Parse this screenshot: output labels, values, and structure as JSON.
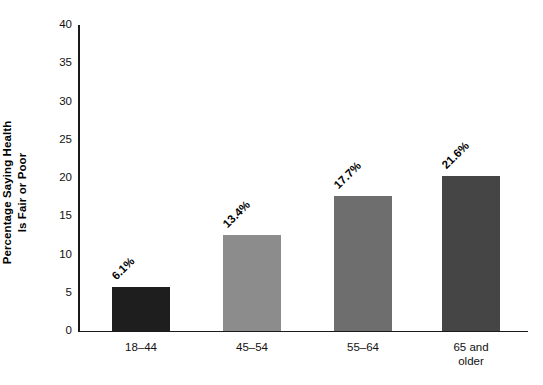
{
  "chart_data": {
    "type": "bar",
    "title": "",
    "subtitle": "",
    "xlabel": "",
    "ylabel": "Percentage Saying Health Is Fair or Poor",
    "ylabel_lines": [
      "Percentage Saying Health",
      "Is Fair or Poor"
    ],
    "categories": [
      "18–44",
      "45–54",
      "55–64",
      "65 and older"
    ],
    "category_label_lines": [
      [
        "18–44"
      ],
      [
        "45–54"
      ],
      [
        "55–64"
      ],
      [
        "65 and",
        "older"
      ]
    ],
    "values": [
      6.1,
      13.4,
      17.7,
      21.6
    ],
    "bar_heights": [
      5.8,
      12.5,
      17.6,
      20.2
    ],
    "data_labels": [
      "6.1%",
      "13.4%",
      "17.7%",
      "21.6%"
    ],
    "bar_colors": [
      "#1e1e1e",
      "#8c8c8c",
      "#6e6e6e",
      "#454545"
    ],
    "ylim": [
      0,
      40
    ],
    "ytick_values": [
      0,
      5,
      10,
      15,
      20,
      25,
      30,
      35,
      40
    ],
    "ytick_labels": [
      "0",
      "5",
      "10",
      "15",
      "20",
      "25",
      "30",
      "35",
      "40"
    ],
    "grid": false,
    "legend": null,
    "legend_position": "none",
    "axis_color": "#1a1a1a",
    "background_color": "#ffffff",
    "data_label_rotation_deg": -45
  }
}
